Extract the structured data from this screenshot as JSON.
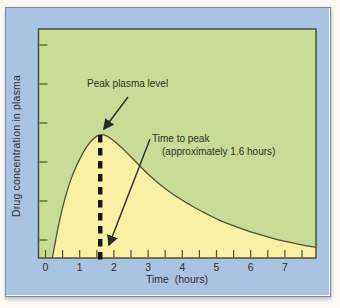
{
  "figure": {
    "background": "#fbfaf6",
    "panel": {
      "bg": "#a9c3e2",
      "border": "#7e8da0"
    },
    "plot": {
      "bg": "#c9dc97",
      "area_fill": "#f8f1a3",
      "frame": "#4f4f3a",
      "dash_color": "#161616",
      "arrow_color": "#2b2b2b"
    },
    "labels": {
      "y_axis": "Drug concentration in plasma",
      "x_axis": "Time  (hours)"
    },
    "annotations": {
      "peak_label": "Peak plasma level",
      "time_to_peak_line1": "Time to peak",
      "time_to_peak_line2": "(approximately 1.6 hours)"
    }
  },
  "chart_data": {
    "type": "area",
    "title": "",
    "xlabel": "Time (hours)",
    "ylabel": "Drug concentration in plasma",
    "xlim": [
      0,
      8
    ],
    "ylim_relative_to_peak": [
      0,
      1.85
    ],
    "grid": false,
    "x_tick_labels": [
      "0",
      "1",
      "2",
      "3",
      "4",
      "5",
      "6",
      "7"
    ],
    "x_tick_label_values": [
      0,
      1,
      2,
      3,
      4,
      5,
      6,
      7
    ],
    "x_minor_tick_step": 0.5,
    "x_last_tick": 7.5,
    "y_tick_count": 6,
    "y_ticks_labeled": false,
    "peak_time_hours": 1.6,
    "peak_value_relative": 1.0,
    "curve": {
      "x": [
        0.2,
        0.3,
        0.4,
        0.5,
        0.65,
        0.8,
        1.0,
        1.2,
        1.4,
        1.6,
        1.8,
        2.0,
        2.25,
        2.5,
        2.75,
        3.0,
        3.25,
        3.5,
        3.75,
        4.0,
        4.25,
        4.5,
        4.75,
        5.0,
        5.25,
        5.5,
        5.75,
        6.0,
        6.25,
        6.5,
        6.75,
        7.0,
        7.25,
        7.5,
        7.7,
        7.93
      ],
      "y": [
        0,
        0.15,
        0.29,
        0.41,
        0.56,
        0.68,
        0.8,
        0.9,
        0.965,
        1.0,
        0.985,
        0.945,
        0.885,
        0.815,
        0.745,
        0.675,
        0.615,
        0.56,
        0.51,
        0.465,
        0.425,
        0.385,
        0.35,
        0.315,
        0.285,
        0.26,
        0.235,
        0.21,
        0.19,
        0.17,
        0.15,
        0.135,
        0.12,
        0.105,
        0.095,
        0.085
      ]
    },
    "annotations": [
      {
        "text": "Peak plasma level",
        "points_to": "curve peak at x = 1.6 hours"
      },
      {
        "text": "Time to peak (approximately 1.6 hours)",
        "points_to": "x-axis at 1.6 hours"
      }
    ]
  }
}
